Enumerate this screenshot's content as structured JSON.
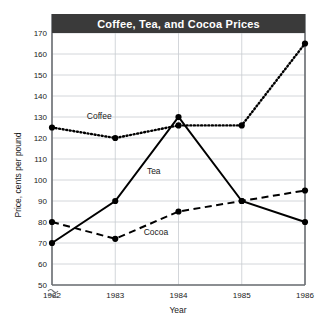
{
  "chart_data": {
    "type": "line",
    "title": "Coffee, Tea, and Cocoa Prices",
    "xlabel": "Year",
    "ylabel": "Price, cents per pound",
    "categories": [
      "1982",
      "1983",
      "1984",
      "1985",
      "1986"
    ],
    "x": [
      1982,
      1983,
      1984,
      1985,
      1986
    ],
    "xlim": [
      1982,
      1986
    ],
    "ylim": [
      50,
      170
    ],
    "ytick_labels": [
      "50",
      "60",
      "70",
      "80",
      "90",
      "100",
      "110",
      "120",
      "130",
      "140",
      "150",
      "160",
      "170"
    ],
    "yticks": [
      50,
      60,
      70,
      80,
      90,
      100,
      110,
      120,
      130,
      140,
      150,
      160,
      170
    ],
    "grid": true,
    "axis_break": true,
    "legend_position": "inline-labels",
    "series": [
      {
        "name": "Coffee",
        "style": "dotted",
        "values": [
          125,
          120,
          126,
          126,
          165
        ],
        "label_x": 1982.55,
        "label_y": 129
      },
      {
        "name": "Tea",
        "style": "solid",
        "values": [
          70,
          90,
          130,
          90,
          80
        ],
        "label_x": 1983.5,
        "label_y": 103
      },
      {
        "name": "Cocoa",
        "style": "dashed",
        "values": [
          80,
          72,
          85,
          90,
          95
        ],
        "label_x": 1983.45,
        "label_y": 74
      }
    ],
    "colors": {
      "title_banner": "#3a3a3a",
      "title_text": "#ffffff",
      "line": "#000000",
      "marker": "#000000",
      "grid": "#c8ccd0",
      "axis": "#6b6f73",
      "background": "#ffffff",
      "text": "#1a1a1a"
    }
  }
}
